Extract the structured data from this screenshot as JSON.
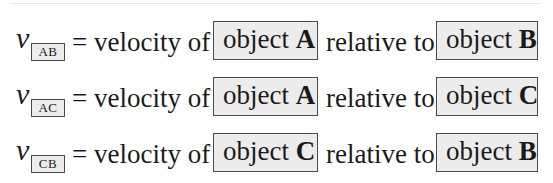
{
  "symbol": "v",
  "equals_phrase": "= velocity of",
  "relative_phrase": "relative to",
  "object_word": "object",
  "colors": {
    "box_fill": "#ececec",
    "box_border": "#4a4a4a",
    "text": "#1a1a1a",
    "background": "#ffffff"
  },
  "rows": [
    {
      "subscript": "AB",
      "subject_object": "A",
      "reference_object": "B"
    },
    {
      "subscript": "AC",
      "subject_object": "A",
      "reference_object": "C"
    },
    {
      "subscript": "CB",
      "subject_object": "C",
      "reference_object": "B"
    }
  ]
}
